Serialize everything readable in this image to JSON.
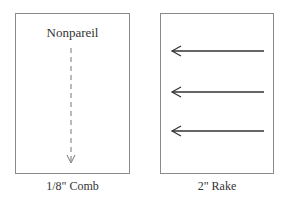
{
  "panels": [
    {
      "id": "comb",
      "title": "Nonpareil",
      "caption": "1/8\" Comb",
      "stroke": {
        "style": "dashed",
        "direction": "down",
        "color": "#777777"
      }
    },
    {
      "id": "rake",
      "caption": "2\" Rake",
      "strokes": [
        {
          "style": "solid",
          "direction": "left",
          "color": "#333333"
        },
        {
          "style": "solid",
          "direction": "left",
          "color": "#333333"
        },
        {
          "style": "solid",
          "direction": "left",
          "color": "#333333"
        }
      ]
    }
  ]
}
